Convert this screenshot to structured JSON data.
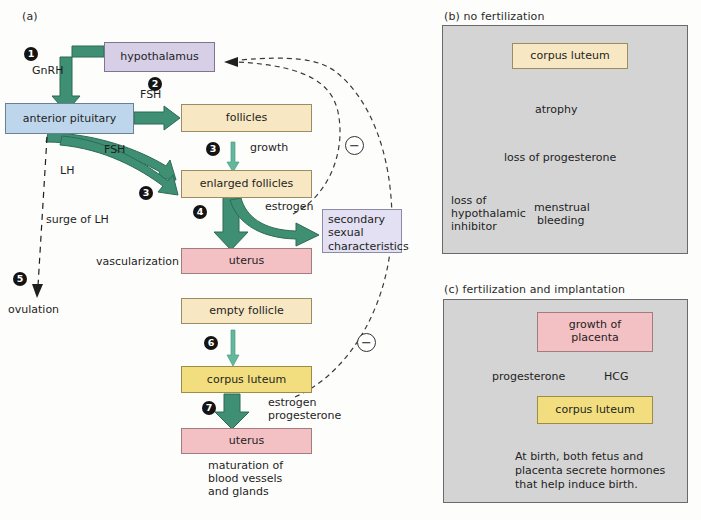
{
  "figure": {
    "panels": [
      {
        "key": "a",
        "label": "(a)"
      },
      {
        "key": "b",
        "label": "(b) no fertilization"
      },
      {
        "key": "c",
        "label": "(c) fertilization and implantation"
      }
    ]
  },
  "panel_a": {
    "nodes": {
      "hypothalamus": "hypothalamus",
      "anterior_pituitary": "anterior pituitary",
      "follicles": "follicles",
      "enlarged_follicles": "enlarged follicles",
      "secondary_sexual": "secondary\nsexual\ncharacteristics",
      "secondary_sexual_line1": "secondary",
      "secondary_sexual_line2": "sexual",
      "secondary_sexual_line3": "characteristics",
      "uterus_1": "uterus",
      "empty_follicle": "empty follicle",
      "corpus_luteum": "corpus luteum",
      "uterus_2": "uterus"
    },
    "labels": {
      "gnrh": "GnRH",
      "fsh_top": "FSH",
      "fsh_mid": "FSH",
      "lh": "LH",
      "surge_of_lh": "surge of LH",
      "ovulation": "ovulation",
      "growth": "growth",
      "estrogen_upper": "estrogen",
      "vascularization": "vascularization",
      "estrogen_lower": "estrogen",
      "progesterone_lower": "progesterone",
      "maturation_1": "maturation of",
      "maturation_2": "blood vessels",
      "maturation_3": "and glands",
      "minus_upper": "−",
      "minus_lower": "−"
    },
    "steps": [
      {
        "n": "1"
      },
      {
        "n": "2"
      },
      {
        "n": "3"
      },
      {
        "n": "3"
      },
      {
        "n": "4"
      },
      {
        "n": "5"
      },
      {
        "n": "6"
      },
      {
        "n": "7"
      }
    ]
  },
  "panel_b": {
    "title": "(b) no fertilization",
    "nodes": {
      "corpus_luteum": "corpus luteum"
    },
    "labels": {
      "atrophy": "atrophy",
      "loss_of_progesterone": "loss of progesterone",
      "loss_inhibitor_1": "loss of",
      "loss_inhibitor_2": "hypothalamic",
      "loss_inhibitor_3": "inhibitor",
      "menstrual_1": "menstrual",
      "menstrual_2": "bleeding"
    }
  },
  "panel_c": {
    "title": "(c) fertilization and implantation",
    "nodes": {
      "growth_of_placenta_1": "growth of",
      "growth_of_placenta_2": "placenta",
      "corpus_luteum": "corpus luteum"
    },
    "labels": {
      "progesterone": "progesterone",
      "hcg": "HCG",
      "note_1": "At birth, both fetus and",
      "note_2": "placenta secrete hormones",
      "note_3": "that help induce birth."
    }
  },
  "colors": {
    "green_arrow": "#3f8f74",
    "green_arrow_light": "#63b79c",
    "blue_box": "#bed6ec",
    "purple_box": "#d6cfe6",
    "lavender_box": "#e2e0f2",
    "cream_box": "#f7e7c2",
    "yellow_box": "#f2de7e",
    "pink_box": "#f3c0c4",
    "gray_panel": "#d4d4d4",
    "background": "#fdfdfb"
  }
}
